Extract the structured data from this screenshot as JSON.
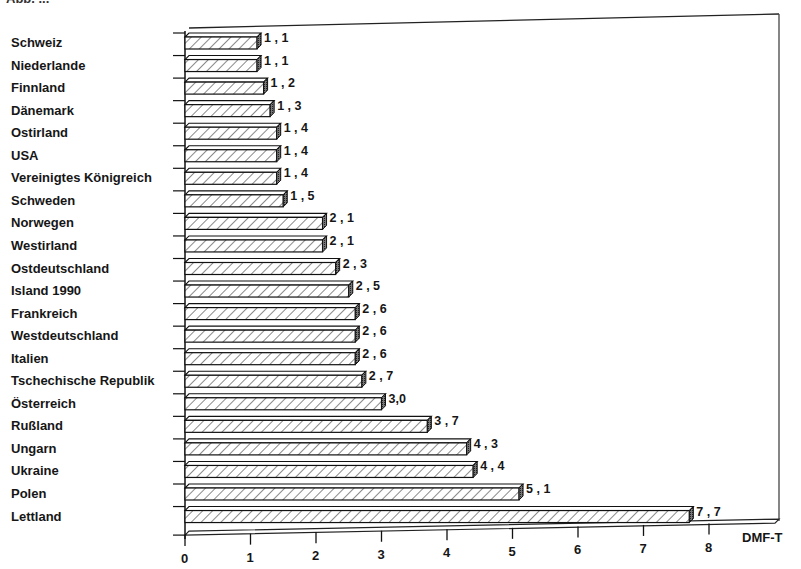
{
  "figure": {
    "title_fragment": "Abb. ...",
    "axis_unit_label": "DMF-T"
  },
  "chart_data": {
    "type": "bar",
    "orientation": "horizontal",
    "title": "",
    "xlabel": "DMF-T",
    "ylabel": "",
    "xlim": [
      0,
      8
    ],
    "xticks": [
      0,
      1,
      2,
      3,
      4,
      5,
      6,
      7,
      8
    ],
    "grid": false,
    "style": "3D hatched bars",
    "categories": [
      "Schweiz",
      "Niederlande",
      "Finnland",
      "Dänemark",
      "Ostirland",
      "USA",
      "Vereinigtes Königreich",
      "Schweden",
      "Norwegen",
      "Westirland",
      "Ostdeutschland",
      "Island 1990",
      "Frankreich",
      "Westdeutschland",
      "Italien",
      "Tschechische Republik",
      "Österreich",
      "Rußland",
      "Ungarn",
      "Ukraine",
      "Polen",
      "Lettland"
    ],
    "values": [
      1.1,
      1.1,
      1.2,
      1.3,
      1.4,
      1.4,
      1.4,
      1.5,
      2.1,
      2.1,
      2.3,
      2.5,
      2.6,
      2.6,
      2.6,
      2.7,
      3.0,
      3.7,
      4.3,
      4.4,
      5.1,
      7.7
    ],
    "value_labels": [
      "1,1",
      "1,1",
      "1,2",
      "1,3",
      "1,4",
      "1,4",
      "1,4",
      "1,5",
      "2,1",
      "2,1",
      "2,3",
      "2,5",
      "2,6",
      "2,6",
      "2,6",
      "2,7",
      "3,0",
      "3,7",
      "4,3",
      "4,4",
      "5,1",
      "7,7"
    ]
  },
  "colors": {
    "ink": "#161616",
    "bar_face": "#ffffff",
    "hatch": "#2a2a2a",
    "side_face": "#555555"
  }
}
